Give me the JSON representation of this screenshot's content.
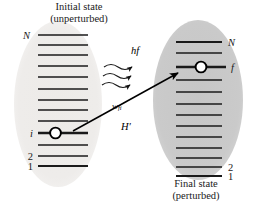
{
  "figure": {
    "title_left_line1": "Initial state",
    "title_left_line2": "(unperturbed)",
    "title_right_line1": "Final state",
    "title_right_line2": "(perturbed)",
    "photon_label": "hf",
    "rate_label_main": "w",
    "rate_label_sub": "fi",
    "perturbation_label": "H′",
    "colors": {
      "background": "#ffffff",
      "left_ellipse_fill": "#eceae7",
      "right_ellipse_fill": "#c9c9c9",
      "level_line": "#1a1a1a",
      "occupied_line": "#000000",
      "arrow": "#000000",
      "text": "#1a1a1a"
    }
  },
  "left_state": {
    "name": "initial",
    "level_count": 13,
    "labels": [
      {
        "text": "N",
        "level_index": 0
      },
      {
        "text": "i",
        "level_index": 9
      },
      {
        "text": "2",
        "level_index": 11
      },
      {
        "text": "1",
        "level_index": 12
      }
    ],
    "occupied_level_index": 9,
    "electron_marker": "circle"
  },
  "right_state": {
    "name": "final",
    "level_count": 13,
    "labels": [
      {
        "text": "N",
        "level_index": 0
      },
      {
        "text": "f",
        "level_index": 2
      },
      {
        "text": "2",
        "level_index": 11
      },
      {
        "text": "1",
        "level_index": 12
      }
    ],
    "occupied_level_index": 2,
    "electron_marker": "circle"
  },
  "annotations": {
    "photon_wave_count": 3,
    "transition_arrow": "i-to-f"
  }
}
